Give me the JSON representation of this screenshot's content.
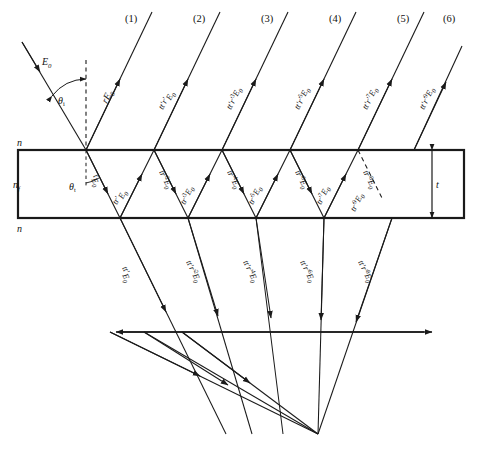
{
  "figure": {
    "stroke_color": "#1a1a1a",
    "background": "#ffffff",
    "media": {
      "above_label": "n",
      "film_label": "n",
      "film_label_sub": "f",
      "below_label": "n",
      "thickness_label": "t"
    },
    "angles": {
      "incidence": "θ",
      "incidence_sub": "i",
      "transmission": "θ",
      "transmission_sub": "t"
    },
    "incident": {
      "amplitude": "E",
      "amplitude_sub": "0"
    },
    "first_reflection": {
      "amplitude": "rE",
      "amplitude_sub": "0"
    },
    "beam_numbers": [
      "(1)",
      "(2)",
      "(3)",
      "(4)",
      "(5)",
      "(6)"
    ],
    "reflected_labels": [
      {
        "prefix": "tt′r′",
        "sup": "",
        "base": "E",
        "sub": "0"
      },
      {
        "prefix": "tt′r′",
        "sup": "3",
        "base": "E",
        "sub": "0"
      },
      {
        "prefix": "tt′r′",
        "sup": "5",
        "base": "E",
        "sub": "0"
      },
      {
        "prefix": "tt′r′",
        "sup": "7",
        "base": "E",
        "sub": "0"
      },
      {
        "prefix": "tt′r′",
        "sup": "9",
        "base": "E",
        "sub": "0"
      }
    ],
    "internal_down_labels": [
      {
        "prefix": "t",
        "sup": "",
        "base": "E",
        "sub": "0"
      },
      {
        "prefix": "tr′",
        "sup": "2",
        "base": "E",
        "sub": "0"
      },
      {
        "prefix": "tr′",
        "sup": "4",
        "base": "E",
        "sub": "0"
      },
      {
        "prefix": "tr′",
        "sup": "6",
        "base": "E",
        "sub": "0"
      },
      {
        "prefix": "tr′",
        "sup": "8",
        "base": "E",
        "sub": "0"
      }
    ],
    "internal_up_labels": [
      {
        "prefix": "tr′",
        "sup": "",
        "base": "E",
        "sub": "0"
      },
      {
        "prefix": "tr′",
        "sup": "3",
        "base": "E",
        "sub": "0"
      },
      {
        "prefix": "tr′",
        "sup": "5",
        "base": "E",
        "sub": "0"
      },
      {
        "prefix": "tr′",
        "sup": "7",
        "base": "E",
        "sub": "0"
      },
      {
        "prefix": "tr′",
        "sup": "9",
        "base": "E",
        "sub": "0"
      }
    ],
    "transmitted_labels": [
      {
        "prefix": "tt′",
        "sup": "",
        "base": "E",
        "sub": "0"
      },
      {
        "prefix": "tt′r′",
        "sup": "2",
        "base": "E",
        "sub": "0"
      },
      {
        "prefix": "tt′r′",
        "sup": "4",
        "base": "E",
        "sub": "0"
      },
      {
        "prefix": "tt′r′",
        "sup": "6",
        "base": "E",
        "sub": "0"
      },
      {
        "prefix": "tt′r′",
        "sup": "8",
        "base": "E",
        "sub": "0"
      }
    ]
  }
}
